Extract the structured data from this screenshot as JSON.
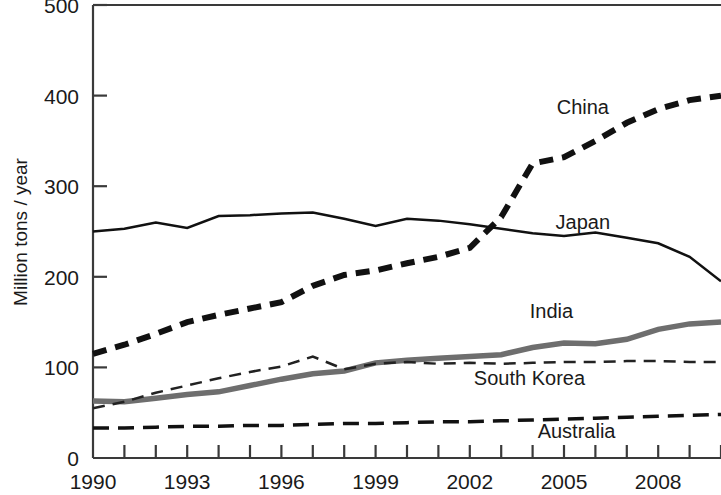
{
  "chart_data": {
    "type": "line",
    "title": "",
    "subtitle": "",
    "xlabel": "",
    "ylabel": "Million tons / year",
    "xlim": [
      1990,
      2010
    ],
    "ylim": [
      0,
      500
    ],
    "grid": false,
    "legend_position": "inline-right",
    "x_tick_labels": [
      "1990",
      "1993",
      "1996",
      "1999",
      "2002",
      "2005",
      "2008"
    ],
    "x_tick_values": [
      1990,
      1993,
      1996,
      1999,
      2002,
      2005,
      2008
    ],
    "x_minor_ticks": [
      1990,
      1991,
      1992,
      1993,
      1994,
      1995,
      1996,
      1997,
      1998,
      1999,
      2000,
      2001,
      2002,
      2003,
      2004,
      2005,
      2006,
      2007,
      2008,
      2009,
      2010
    ],
    "y_tick_labels": [
      "0",
      "100",
      "200",
      "300",
      "400",
      "500"
    ],
    "y_tick_values": [
      0,
      100,
      200,
      300,
      400,
      500
    ],
    "x": [
      1990,
      1991,
      1992,
      1993,
      1994,
      1995,
      1996,
      1997,
      1998,
      1999,
      2000,
      2001,
      2002,
      2003,
      2004,
      2005,
      2006,
      2007,
      2008,
      2009,
      2010
    ],
    "series": [
      {
        "name": "China",
        "label": "China",
        "color": "#111111",
        "style": "thick-dashed",
        "width": 6,
        "dash": "14,9",
        "label_x": 2005.6,
        "label_y": 387,
        "values": [
          115,
          125,
          137,
          150,
          158,
          165,
          172,
          190,
          202,
          207,
          215,
          222,
          232,
          266,
          325,
          332,
          350,
          370,
          385,
          395,
          400
        ]
      },
      {
        "name": "Japan",
        "label": "Japan",
        "color": "#111111",
        "style": "solid",
        "width": 2.5,
        "dash": "",
        "label_x": 2005.6,
        "label_y": 260,
        "values": [
          250,
          253,
          260,
          254,
          267,
          268,
          270,
          271,
          264,
          256,
          264,
          262,
          258,
          253,
          248,
          245,
          249,
          243,
          237,
          222,
          195
        ]
      },
      {
        "name": "India",
        "label": "India",
        "color": "#6e6e6e",
        "style": "thick-solid",
        "width": 5.5,
        "dash": "",
        "label_x": 2004.6,
        "label_y": 162,
        "values": [
          63,
          62,
          66,
          70,
          73,
          80,
          87,
          93,
          96,
          105,
          108,
          110,
          112,
          114,
          122,
          127,
          126,
          131,
          142,
          148,
          150
        ]
      },
      {
        "name": "South Korea",
        "label": "South Korea",
        "color": "#222222",
        "style": "thin-dashed",
        "width": 2.5,
        "dash": "12,8",
        "label_x": 2003.9,
        "label_y": 88,
        "values": [
          55,
          62,
          72,
          80,
          88,
          95,
          101,
          112,
          98,
          104,
          106,
          104,
          105,
          104,
          105,
          106,
          106,
          107,
          107,
          106,
          106
        ]
      },
      {
        "name": "Australia",
        "label": "Australia",
        "color": "#111111",
        "style": "medium-dashed",
        "width": 3.5,
        "dash": "16,9",
        "label_x": 2005.4,
        "label_y": 30,
        "values": [
          33,
          33,
          34,
          35,
          35,
          36,
          36,
          37,
          38,
          38,
          39,
          40,
          40,
          41,
          42,
          43,
          44,
          45,
          46,
          47,
          48
        ]
      }
    ]
  }
}
